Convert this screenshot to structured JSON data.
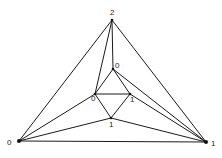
{
  "diagram": {
    "type": "triangulated-graph",
    "vertices": [
      {
        "id": "top",
        "label": "2",
        "x": 112,
        "y": 20,
        "lx": 110,
        "ly": 15
      },
      {
        "id": "bottom-left",
        "label": "0",
        "x": 19,
        "y": 141,
        "lx": 7,
        "ly": 145
      },
      {
        "id": "bottom-right",
        "label": "1",
        "x": 206,
        "y": 142,
        "lx": 211,
        "ly": 146
      },
      {
        "id": "inner-top",
        "label": "0",
        "x": 113,
        "y": 69,
        "lx": 115,
        "ly": 68
      },
      {
        "id": "inner-left",
        "label": "0",
        "x": 95,
        "y": 94,
        "lx": 91,
        "ly": 101
      },
      {
        "id": "inner-right",
        "label": "1",
        "x": 130,
        "y": 94,
        "lx": 130,
        "ly": 102
      },
      {
        "id": "inner-bottom",
        "label": "1",
        "x": 111,
        "y": 118,
        "lx": 109,
        "ly": 127
      }
    ],
    "edges": [
      [
        "top",
        "bottom-left"
      ],
      [
        "top",
        "bottom-right"
      ],
      [
        "bottom-left",
        "bottom-right"
      ],
      [
        "top",
        "inner-left"
      ],
      [
        "top",
        "inner-top"
      ],
      [
        "inner-top",
        "inner-left"
      ],
      [
        "inner-top",
        "inner-right"
      ],
      [
        "inner-left",
        "inner-right"
      ],
      [
        "inner-left",
        "inner-bottom"
      ],
      [
        "inner-right",
        "inner-bottom"
      ],
      [
        "bottom-left",
        "inner-left"
      ],
      [
        "bottom-left",
        "inner-bottom"
      ],
      [
        "inner-top",
        "bottom-right"
      ],
      [
        "inner-right",
        "bottom-right"
      ],
      [
        "inner-bottom",
        "bottom-right"
      ]
    ],
    "colors": {
      "stroke": "#1a1a1a",
      "vertex": "#111111",
      "label": "#222222",
      "background": "#ffffff"
    }
  }
}
